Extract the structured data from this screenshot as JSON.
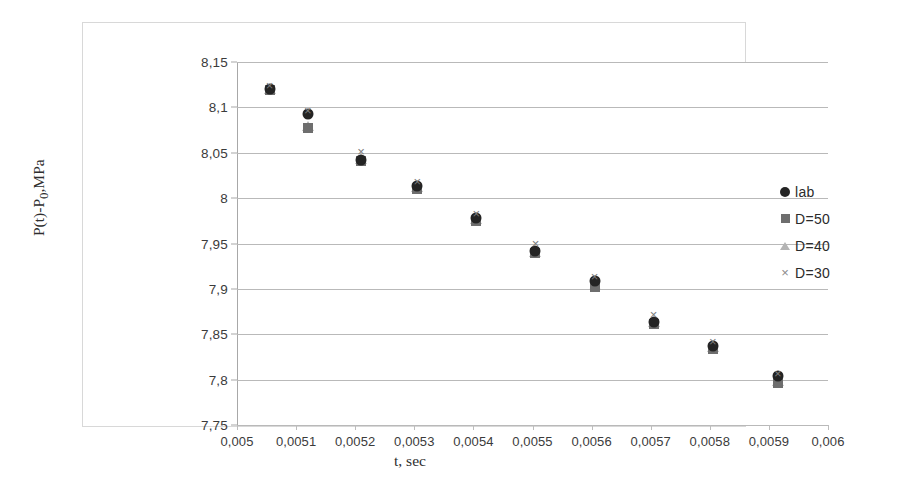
{
  "chart_data": {
    "type": "scatter",
    "title": "",
    "xlabel": "t, sec",
    "ylabel": "P(t)-P0,MPa",
    "ylabel_parts": {
      "prefix": "P(t)-P",
      "sub": "0",
      "suffix": ",MPa"
    },
    "xlim": [
      0.005,
      0.006
    ],
    "ylim": [
      7.75,
      8.15
    ],
    "grid": "horizontal",
    "legend_position": "right",
    "decimal_separator": ",",
    "xticks": [
      0.005,
      0.0051,
      0.0052,
      0.0053,
      0.0054,
      0.0055,
      0.0056,
      0.0057,
      0.0058,
      0.0059,
      0.006
    ],
    "xtick_labels": [
      "0,005",
      "0,0051",
      "0,0052",
      "0,0053",
      "0,0054",
      "0,0055",
      "0,0056",
      "0,0057",
      "0,0058",
      "0,0059",
      "0,006"
    ],
    "yticks": [
      7.75,
      7.8,
      7.85,
      7.9,
      7.95,
      8.0,
      8.05,
      8.1,
      8.15
    ],
    "ytick_labels": [
      "7,75",
      "7,8",
      "7,85",
      "7,9",
      "7,95",
      "8",
      "8,05",
      "8,1",
      "8,15"
    ],
    "x": [
      0.005055,
      0.00512,
      0.00521,
      0.005305,
      0.005405,
      0.005505,
      0.005605,
      0.005705,
      0.005805,
      0.005915
    ],
    "series": [
      {
        "name": "lab",
        "marker": "circle",
        "color": "#242424",
        "values": [
          8.12,
          8.093,
          8.042,
          8.013,
          7.978,
          7.942,
          7.909,
          7.864,
          7.837,
          7.804
        ]
      },
      {
        "name": "D=50",
        "marker": "square",
        "color": "#6e6e6e",
        "values": [
          8.119,
          8.077,
          8.041,
          8.01,
          7.975,
          7.939,
          7.902,
          7.861,
          7.834,
          7.796
        ]
      },
      {
        "name": "D=40",
        "marker": "triangle",
        "color": "#b4b4b4",
        "values": [
          8.12,
          8.079,
          8.043,
          8.012,
          7.977,
          7.941,
          7.904,
          7.863,
          7.836,
          7.798
        ]
      },
      {
        "name": "D=30",
        "marker": "cross",
        "color": "#7d7d7d",
        "values": [
          8.124,
          8.096,
          8.051,
          8.018,
          7.983,
          7.949,
          7.913,
          7.871,
          7.841,
          7.806
        ]
      }
    ]
  },
  "legend": {
    "items": [
      {
        "label": "lab"
      },
      {
        "label": "D=50"
      },
      {
        "label": "D=40"
      },
      {
        "label": "D=30"
      }
    ]
  }
}
